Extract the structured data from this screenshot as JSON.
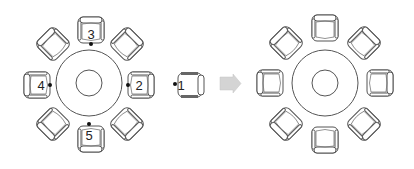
{
  "diagram": {
    "type": "seating-transformation",
    "colors": {
      "stroke": "#555555",
      "arrow": "#d0d0d0",
      "dot": "#111111",
      "background": "#ffffff"
    },
    "left_table": {
      "center": [
        89,
        83
      ],
      "outer_radius": 33,
      "inner_radius": 13,
      "chairs_count": 8,
      "numbered_seats": [
        {
          "label": "1",
          "position": "detached-right",
          "x": 188,
          "y": 85
        },
        {
          "label": "2",
          "position": "east",
          "x": 139,
          "y": 85
        },
        {
          "label": "3",
          "position": "north",
          "x": 91,
          "y": 34
        },
        {
          "label": "4",
          "position": "west",
          "x": 40,
          "y": 85
        },
        {
          "label": "5",
          "position": "south",
          "x": 91,
          "y": 135
        }
      ]
    },
    "arrow": {
      "direction": "right",
      "x": 220,
      "y": 75,
      "width": 20,
      "height": 17
    },
    "right_table": {
      "center": [
        325,
        83
      ],
      "outer_radius": 33,
      "inner_radius": 13,
      "chairs_count": 8
    }
  }
}
